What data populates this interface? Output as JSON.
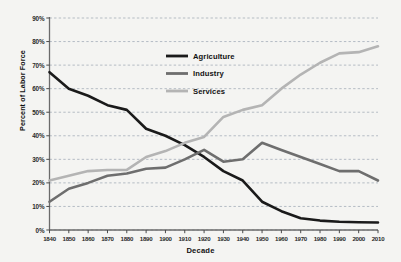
{
  "chart_data": {
    "type": "line",
    "title": "",
    "xlabel": "Decade",
    "ylabel": "Percent of Labor Force",
    "x": [
      1840,
      1850,
      1860,
      1870,
      1880,
      1890,
      1900,
      1910,
      1920,
      1930,
      1940,
      1950,
      1960,
      1970,
      1980,
      1990,
      2000,
      2010
    ],
    "categories": [
      "1840",
      "1850",
      "1860",
      "1870",
      "1880",
      "1890",
      "1900",
      "1910",
      "1920",
      "1930",
      "1940",
      "1950",
      "1960",
      "1970",
      "1980",
      "1990",
      "2000",
      "2010"
    ],
    "xlim": [
      1840,
      2010
    ],
    "ylim": [
      0,
      90
    ],
    "ytick_values": [
      0,
      10,
      20,
      30,
      40,
      50,
      60,
      70,
      80,
      90
    ],
    "ytick_labels": [
      "0%",
      "10%",
      "20%",
      "30%",
      "40%",
      "50%",
      "60%",
      "70%",
      "80%",
      "90%"
    ],
    "grid": true,
    "grid_style": "dashed-horizontal",
    "legend_position": "upper-center",
    "series": [
      {
        "name": "Agriculture",
        "color": "#1a1a1a",
        "values": [
          67,
          60,
          57,
          53,
          51,
          43,
          40,
          36,
          31,
          25,
          21,
          12,
          8,
          5,
          4,
          3.5,
          3.3,
          3.2
        ]
      },
      {
        "name": "Industry",
        "color": "#6e6e6e",
        "values": [
          12,
          17.5,
          20,
          23,
          24,
          26,
          26.5,
          30,
          34,
          29,
          30,
          37,
          34,
          31,
          28,
          25,
          25,
          21
        ]
      },
      {
        "name": "Services",
        "color": "#b4b4b4",
        "values": [
          21,
          23,
          25,
          25.5,
          25.5,
          31,
          33.5,
          37,
          39.5,
          48,
          51,
          53,
          60,
          66,
          71,
          75,
          75.5,
          78
        ]
      }
    ]
  },
  "legend": {
    "items": [
      {
        "label": "Agriculture",
        "color": "#1a1a1a"
      },
      {
        "label": "Industry",
        "color": "#6e6e6e"
      },
      {
        "label": "Services",
        "color": "#b4b4b4"
      }
    ]
  },
  "axes": {
    "x_title": "Decade",
    "y_title": "Percent of Labor Force"
  }
}
